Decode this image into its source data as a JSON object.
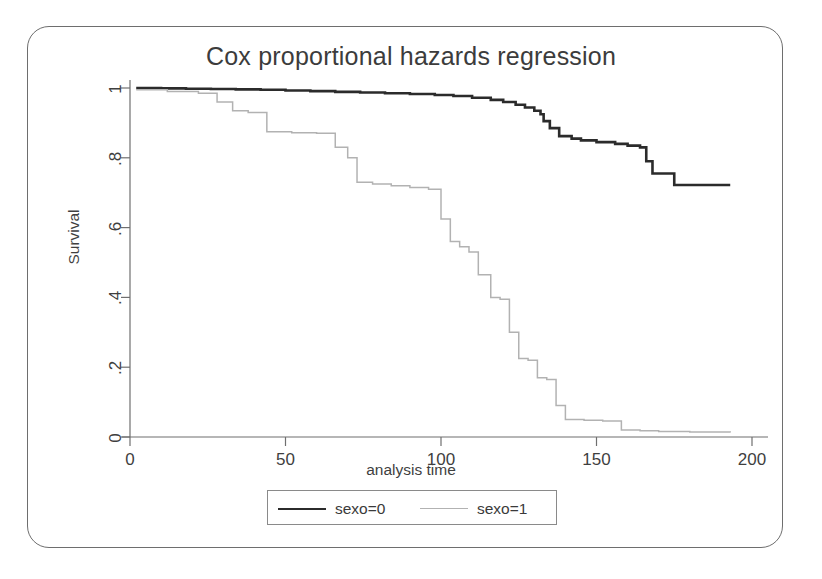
{
  "figure": {
    "frame_color": "#6e6e6e",
    "background": "#ffffff"
  },
  "chart_data": {
    "type": "line",
    "title": "Cox proportional hazards regression",
    "xlabel": "analysis time",
    "ylabel": "Survival",
    "xlim": [
      0,
      200
    ],
    "ylim": [
      0,
      1
    ],
    "xticks": [
      0,
      50,
      100,
      150,
      200
    ],
    "xtick_labels": [
      "0",
      "50",
      "100",
      "150",
      "200"
    ],
    "yticks": [
      0,
      0.2,
      0.4,
      0.6,
      0.8,
      1
    ],
    "ytick_labels": [
      "0",
      ".2",
      ".4",
      ".6",
      ".8",
      "1"
    ],
    "grid": false,
    "legend_position": "bottom-center",
    "step_style": "post",
    "series": [
      {
        "name": "sexo=0",
        "color": "#2b2b2b",
        "line_width": 2.6,
        "x": [
          2,
          10,
          18,
          26,
          34,
          42,
          50,
          58,
          66,
          74,
          82,
          90,
          98,
          104,
          110,
          116,
          120,
          124,
          127,
          130,
          132,
          133,
          135,
          138,
          142,
          145,
          150,
          156,
          160,
          164,
          166,
          168,
          175,
          185,
          193
        ],
        "y": [
          1.0,
          0.999,
          0.998,
          0.997,
          0.996,
          0.995,
          0.993,
          0.991,
          0.989,
          0.987,
          0.985,
          0.983,
          0.98,
          0.977,
          0.972,
          0.966,
          0.96,
          0.952,
          0.944,
          0.935,
          0.925,
          0.905,
          0.885,
          0.862,
          0.855,
          0.85,
          0.845,
          0.84,
          0.835,
          0.83,
          0.79,
          0.755,
          0.722,
          0.722,
          0.722
        ]
      },
      {
        "name": "sexo=1",
        "color": "#b2b2b2",
        "line_width": 1.5,
        "x": [
          2,
          12,
          22,
          28,
          33,
          38,
          44,
          52,
          60,
          66,
          70,
          73,
          78,
          84,
          90,
          96,
          100,
          103,
          106,
          109,
          112,
          116,
          119,
          122,
          125,
          128,
          131,
          134,
          137,
          140,
          146,
          152,
          158,
          164,
          170,
          180,
          193
        ],
        "y": [
          0.995,
          0.99,
          0.985,
          0.96,
          0.935,
          0.93,
          0.875,
          0.872,
          0.87,
          0.83,
          0.8,
          0.73,
          0.725,
          0.72,
          0.715,
          0.71,
          0.625,
          0.56,
          0.545,
          0.53,
          0.465,
          0.4,
          0.395,
          0.3,
          0.225,
          0.22,
          0.17,
          0.165,
          0.09,
          0.05,
          0.048,
          0.046,
          0.02,
          0.018,
          0.016,
          0.014,
          0.013
        ]
      }
    ]
  },
  "legend": {
    "entries": [
      {
        "label": "sexo=0",
        "color": "#2b2b2b",
        "line_width": 2.6
      },
      {
        "label": "sexo=1",
        "color": "#b2b2b2",
        "line_width": 1.5
      }
    ]
  }
}
